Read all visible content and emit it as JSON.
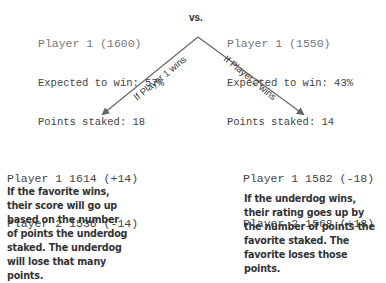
{
  "players": {
    "left": {
      "title": "Player 1 (1600)",
      "expected": "Expected to win: 57%",
      "staked": "Points staked: 18"
    },
    "right": {
      "title": "Player 1 (1550)",
      "expected": "Expected to win: 43%",
      "staked": "Points staked: 14"
    }
  },
  "vs_label": "vs.",
  "branches": {
    "left": {
      "label": "If Player 1 wins",
      "result_line1": "Player 1 1614 (+14)",
      "result_line2": "Player 2 1536 (-14)",
      "description": "If the favorite wins, their score will go up based on the number of points the underdog staked. The underdog will lose that many points."
    },
    "right": {
      "label": "If Player 2 wins",
      "result_line1": "Player 1 1582 (-18)",
      "result_line2": "Player 2 1568 (+18)",
      "description": "If the underdog wins, their rating goes up by the number of points the favorite staked. The favorite loses those points."
    }
  },
  "colors": {
    "arrow": "#666666",
    "mono_text": "#444444",
    "title_text": "#777777",
    "desc_text": "#333333"
  }
}
